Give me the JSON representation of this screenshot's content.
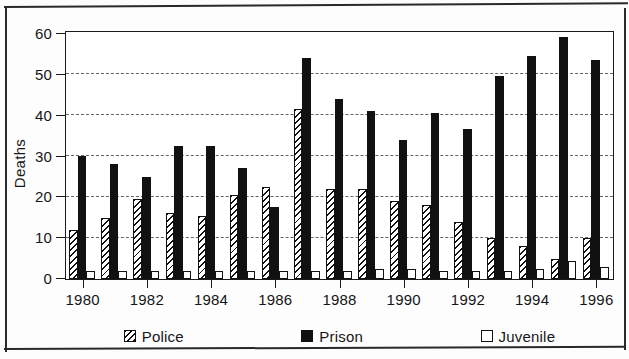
{
  "chart_data": {
    "type": "bar",
    "title": "",
    "xlabel": "",
    "ylabel": "Deaths",
    "ylim": [
      0,
      60
    ],
    "ytick_values": [
      0,
      10,
      20,
      30,
      40,
      50,
      60
    ],
    "ytick_labels": [
      "0",
      "10",
      "20",
      "30",
      "40",
      "50",
      "60"
    ],
    "grid": true,
    "grid_style": "dotted-horizontal",
    "legend_position": "bottom",
    "categories": [
      1980,
      1981,
      1982,
      1983,
      1984,
      1985,
      1986,
      1987,
      1988,
      1989,
      1990,
      1991,
      1992,
      1993,
      1994,
      1995,
      1996
    ],
    "xtick_labels": [
      "1980",
      "1982",
      "1984",
      "1986",
      "1988",
      "1990",
      "1992",
      "1994",
      "1996"
    ],
    "series": [
      {
        "name": "Police",
        "pattern": "diagonal-hatch",
        "color": "#ffffff",
        "values": [
          12,
          15,
          19.5,
          16,
          15.5,
          20.5,
          22.5,
          41.5,
          22,
          22,
          19,
          18,
          14,
          10,
          8,
          5,
          10
        ]
      },
      {
        "name": "Prison",
        "pattern": "solid",
        "color": "#111111",
        "values": [
          30,
          28,
          25,
          32.5,
          32.5,
          27,
          17.5,
          54,
          44,
          41,
          34,
          40.5,
          36.5,
          49.5,
          54.5,
          59,
          53.5
        ]
      },
      {
        "name": "Juvenile",
        "pattern": "open",
        "color": "#ffffff",
        "values": [
          2,
          2,
          2,
          2,
          2,
          2,
          2,
          2,
          2,
          2.5,
          2.5,
          2,
          2,
          2,
          2.5,
          4.5,
          3
        ]
      }
    ]
  },
  "legend": {
    "items": [
      {
        "label": "Police"
      },
      {
        "label": "Prison"
      },
      {
        "label": "Juvenile"
      }
    ]
  }
}
